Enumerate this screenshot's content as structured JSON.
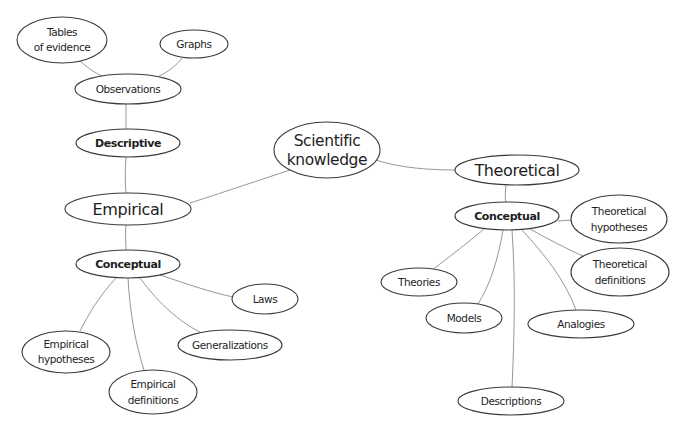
{
  "diagram": {
    "type": "concept-map",
    "root": "Scientific knowledge",
    "nodes": {
      "scientific_knowledge": {
        "line1": "Scientific",
        "line2": "knowledge"
      },
      "empirical": {
        "label": "Empirical"
      },
      "theoretical": {
        "label": "Theoretical"
      },
      "descriptive": {
        "label": "Descriptive"
      },
      "observations": {
        "label": "Observations"
      },
      "tables_of_evidence": {
        "line1": "Tables",
        "line2": "of evidence"
      },
      "graphs": {
        "label": "Graphs"
      },
      "empirical_conceptual": {
        "label": "Conceptual"
      },
      "laws": {
        "label": "Laws"
      },
      "generalizations": {
        "label": "Generalizations"
      },
      "empirical_hypotheses": {
        "line1": "Empirical",
        "line2": "hypotheses"
      },
      "empirical_definitions": {
        "line1": "Empirical",
        "line2": "definitions"
      },
      "theoretical_conceptual": {
        "label": "Conceptual"
      },
      "theoretical_hypotheses": {
        "line1": "Theoretical",
        "line2": "hypotheses"
      },
      "theoretical_definitions": {
        "line1": "Theoretical",
        "line2": "definitions"
      },
      "theories": {
        "label": "Theories"
      },
      "models": {
        "label": "Models"
      },
      "analogies": {
        "label": "Analogies"
      },
      "descriptions": {
        "label": "Descriptions"
      }
    },
    "edges": [
      [
        "Scientific knowledge",
        "Empirical"
      ],
      [
        "Scientific knowledge",
        "Theoretical"
      ],
      [
        "Empirical",
        "Descriptive"
      ],
      [
        "Descriptive",
        "Observations"
      ],
      [
        "Observations",
        "Tables of evidence"
      ],
      [
        "Observations",
        "Graphs"
      ],
      [
        "Empirical",
        "Conceptual (empirical)"
      ],
      [
        "Conceptual (empirical)",
        "Laws"
      ],
      [
        "Conceptual (empirical)",
        "Generalizations"
      ],
      [
        "Conceptual (empirical)",
        "Empirical hypotheses"
      ],
      [
        "Conceptual (empirical)",
        "Empirical definitions"
      ],
      [
        "Theoretical",
        "Conceptual (theoretical)"
      ],
      [
        "Conceptual (theoretical)",
        "Theoretical hypotheses"
      ],
      [
        "Conceptual (theoretical)",
        "Theoretical definitions"
      ],
      [
        "Conceptual (theoretical)",
        "Theories"
      ],
      [
        "Conceptual (theoretical)",
        "Models"
      ],
      [
        "Conceptual (theoretical)",
        "Analogies"
      ],
      [
        "Conceptual (theoretical)",
        "Descriptions"
      ]
    ],
    "colors": {
      "node_stroke": "#3a3a3a",
      "edge_stroke": "#8a8a8a",
      "text": "#1e1e1e",
      "background": "#ffffff"
    }
  }
}
